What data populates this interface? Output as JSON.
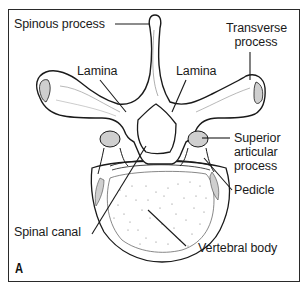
{
  "figure": {
    "panel_letter": "A",
    "colors": {
      "border": "#2a2a2a",
      "outline": "#1a1a1a",
      "facet_fill": "#cfcfcf",
      "background": "#ffffff"
    }
  },
  "labels": {
    "spinous_process": "Spinous process",
    "lamina_left": "Lamina",
    "lamina_right": "Lamina",
    "transverse_process_line1": "Transverse",
    "transverse_process_line2": "process",
    "superior_articular_line1": "Superior",
    "superior_articular_line2": "articular",
    "superior_articular_line3": "process",
    "pedicle": "Pedicle",
    "spinal_canal": "Spinal canal",
    "vertebral_body": "Vertebral body"
  }
}
